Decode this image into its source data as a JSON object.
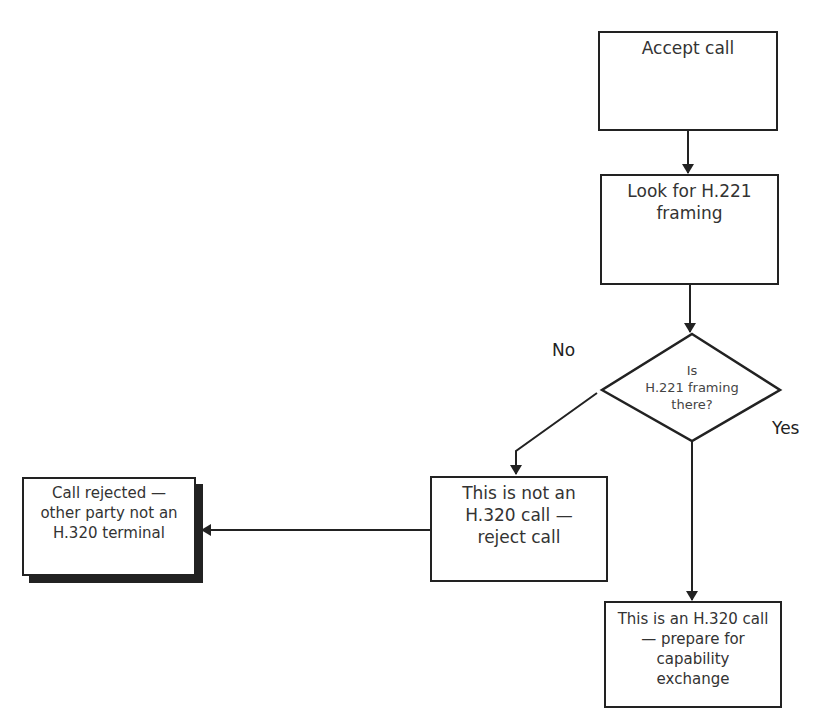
{
  "diagram": {
    "type": "flowchart",
    "nodes": {
      "accept_call": {
        "lines": [
          "Accept call"
        ]
      },
      "look_for_framing": {
        "lines": [
          "Look for H.221",
          "framing"
        ]
      },
      "decision": {
        "lines": [
          "Is",
          "H.221 framing",
          "there?"
        ]
      },
      "not_h320": {
        "lines": [
          "This is not an",
          "H.320 call —",
          "reject call"
        ]
      },
      "call_rejected": {
        "lines": [
          "Call rejected —",
          "other party not an",
          "H.320 terminal"
        ]
      },
      "is_h320": {
        "lines": [
          "This is an H.320 call",
          "— prepare for",
          "capability",
          "exchange"
        ]
      }
    },
    "edge_labels": {
      "no": "No",
      "yes": "Yes"
    },
    "edges": [
      {
        "from": "accept_call",
        "to": "look_for_framing"
      },
      {
        "from": "look_for_framing",
        "to": "decision"
      },
      {
        "from": "decision",
        "to": "not_h320",
        "label": "No"
      },
      {
        "from": "decision",
        "to": "is_h320",
        "label": "Yes"
      },
      {
        "from": "not_h320",
        "to": "call_rejected"
      }
    ],
    "colors": {
      "stroke": "#222222",
      "text": "#333333",
      "background": "#ffffff"
    }
  }
}
